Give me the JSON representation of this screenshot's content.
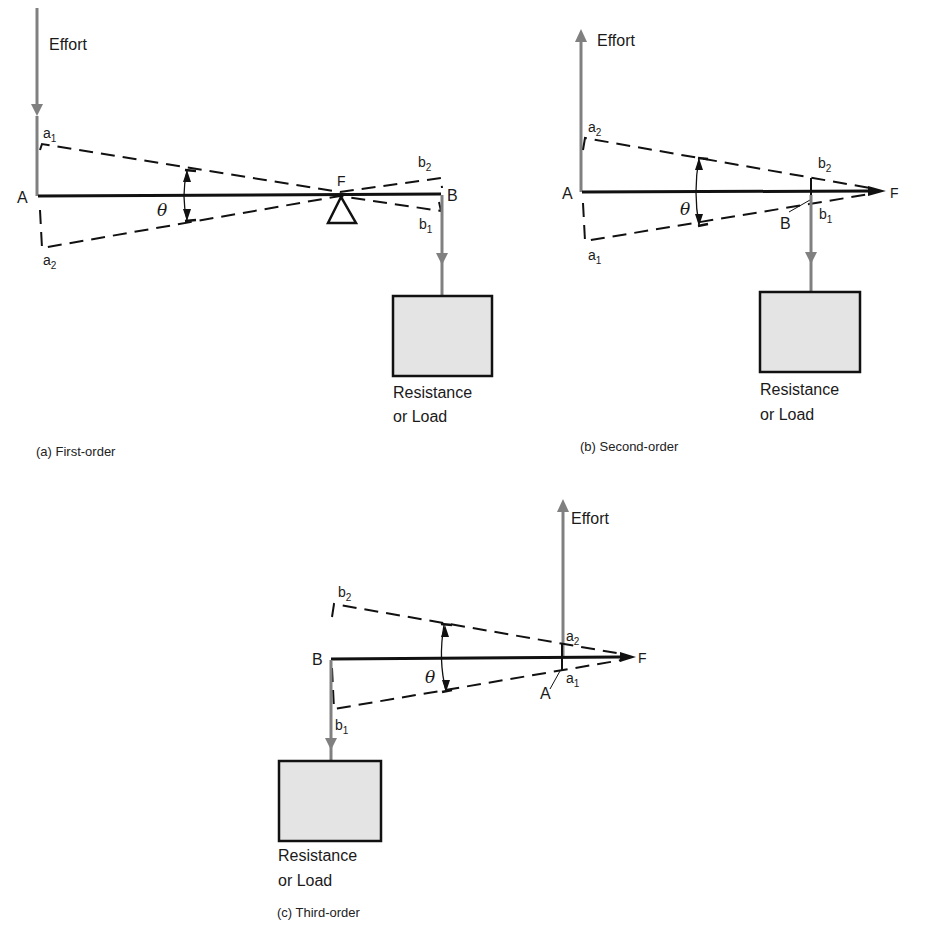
{
  "figure": {
    "panels": [
      {
        "id": "a",
        "caption": "(a)  First-order",
        "effort_label": "Effort",
        "effort_direction": "down",
        "load_label_line1": "Resistance",
        "load_label_line2": "or Load",
        "points": {
          "A": "A",
          "B": "B",
          "F": "F",
          "a1": "a",
          "a1_sub": "1",
          "a2": "a",
          "a2_sub": "2",
          "b1": "b",
          "b1_sub": "1",
          "b2": "b",
          "b2_sub": "2"
        },
        "angle": "θ"
      },
      {
        "id": "b",
        "caption": "(b)  Second-order",
        "effort_label": "Effort",
        "effort_direction": "up",
        "load_label_line1": "Resistance",
        "load_label_line2": "or Load",
        "points": {
          "A": "A",
          "B": "B",
          "F": "F",
          "a1": "a",
          "a1_sub": "1",
          "a2": "a",
          "a2_sub": "2",
          "b1": "b",
          "b1_sub": "1",
          "b2": "b",
          "b2_sub": "2"
        },
        "angle": "θ"
      },
      {
        "id": "c",
        "caption": "(c)  Third-order",
        "effort_label": "Effort",
        "effort_direction": "up",
        "load_label_line1": "Resistance",
        "load_label_line2": "or Load",
        "points": {
          "A": "A",
          "B": "B",
          "F": "F",
          "a1": "a",
          "a1_sub": "1",
          "a2": "a",
          "a2_sub": "2",
          "b1": "b",
          "b1_sub": "1",
          "b2": "b",
          "b2_sub": "2"
        },
        "angle": "θ"
      }
    ],
    "colors": {
      "lever": "#111111",
      "force": "#808080",
      "load_fill": "#e4e4e4"
    }
  }
}
